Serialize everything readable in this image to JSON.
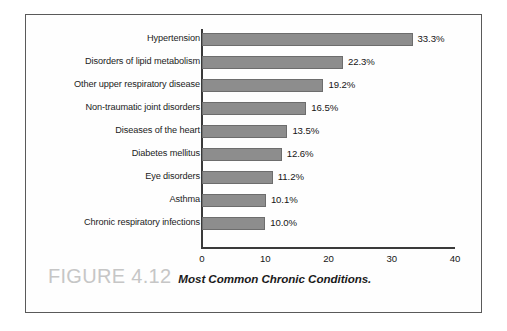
{
  "figure": {
    "number_label": "FIGURE 4.12",
    "caption": "Most Common Chronic Conditions."
  },
  "chart_data": {
    "type": "bar",
    "orientation": "horizontal",
    "title": "Most Common Chronic Conditions.",
    "xlabel": "",
    "ylabel": "",
    "xlim": [
      0,
      40
    ],
    "xticks": [
      "0",
      "10",
      "20",
      "30",
      "40"
    ],
    "xtick_values": [
      0,
      10,
      20,
      30,
      40
    ],
    "grid": false,
    "legend": null,
    "bar_color": "#8d8d8d",
    "bar_edge_color": "#6d6d6d",
    "categories": [
      "Hypertension",
      "Disorders of lipid metabolism",
      "Other upper respiratory disease",
      "Non-traumatic joint disorders",
      "Diseases of the heart",
      "Diabetes mellitus",
      "Eye disorders",
      "Asthma",
      "Chronic respiratory infections"
    ],
    "values": [
      33.3,
      22.3,
      19.2,
      16.5,
      13.5,
      12.6,
      11.2,
      10.1,
      10.0
    ],
    "data_labels": [
      "33.3%",
      "22.3%",
      "19.2%",
      "16.5%",
      "13.5%",
      "12.6%",
      "11.2%",
      "10.1%",
      "10.0%"
    ]
  }
}
